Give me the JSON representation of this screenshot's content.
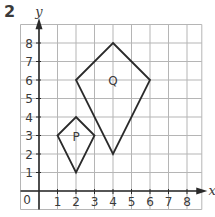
{
  "question_number": "2",
  "axes": {
    "x_label": "x",
    "y_label": "y",
    "origin_label": "0",
    "x_ticks": [
      "1",
      "2",
      "3",
      "4",
      "5",
      "6",
      "7",
      "8"
    ],
    "y_ticks": [
      "1",
      "2",
      "3",
      "4",
      "5",
      "6",
      "7",
      "8"
    ]
  },
  "shapes": [
    {
      "label": "P",
      "type": "kite",
      "vertices": [
        [
          2,
          4
        ],
        [
          3,
          3
        ],
        [
          2,
          1
        ],
        [
          1,
          3
        ]
      ],
      "label_pos": [
        2,
        3
      ]
    },
    {
      "label": "Q",
      "type": "kite",
      "vertices": [
        [
          4,
          8
        ],
        [
          6,
          6
        ],
        [
          4,
          2
        ],
        [
          2,
          6
        ]
      ],
      "label_pos": [
        4,
        6
      ]
    }
  ],
  "colors": {
    "grid": "#b5b5b5",
    "axis": "#2a2a2a",
    "shape_stroke": "#2a2a2a",
    "text": "#3a3a3a"
  }
}
